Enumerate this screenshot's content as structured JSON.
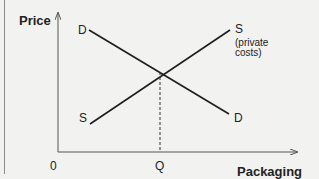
{
  "diagram": {
    "type": "supply-demand",
    "y_axis_label": "Price",
    "x_axis_label": "Packaging",
    "origin_label": "0",
    "equilibrium_quantity_label": "Q",
    "demand": {
      "label_start": "D",
      "label_end": "D"
    },
    "supply": {
      "label_start": "S",
      "label_end": "S",
      "note_line1": "(private",
      "note_line2": "costs)"
    }
  },
  "colors": {
    "background": "#f2f2f0",
    "line": "#1e1e1e",
    "axis": "#555555"
  }
}
